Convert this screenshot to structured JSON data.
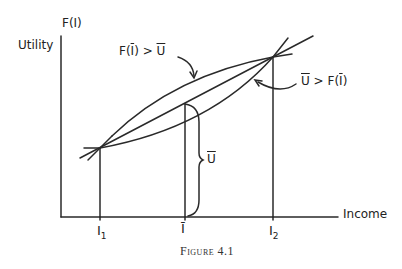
{
  "figure": {
    "caption": "Figure 4.1",
    "y_axis_label_top": "F(I)",
    "y_axis_label": "Utility",
    "x_axis_label": "Income",
    "tick_labels": {
      "i1": "I",
      "i1_sub": "1",
      "ibar": "Ī",
      "i2": "I",
      "i2_sub": "2"
    },
    "annotations": {
      "upper": {
        "text_prefix": "F(",
        "text_bar": "I",
        "text_suffix": ") > ",
        "text_rhs": "U"
      },
      "lower": {
        "text_lhs": "U",
        "text_mid": " > F(",
        "text_bar": "I",
        "text_suffix": ")"
      },
      "brace": {
        "text": "U"
      }
    },
    "stroke_color": "#2a2a2a"
  }
}
